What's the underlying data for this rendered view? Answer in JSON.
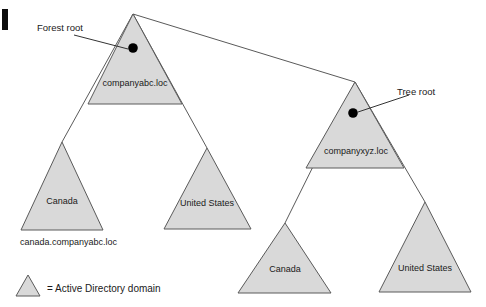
{
  "diagram": {
    "title_marker": "",
    "annotations": [
      {
        "id": "forest-root",
        "label": "Forest root"
      },
      {
        "id": "tree-root",
        "label": "Tree root"
      }
    ],
    "domains": [
      {
        "id": "companyabc",
        "label": "companyabc.loc",
        "role": "forest-root-domain"
      },
      {
        "id": "canada-abc",
        "label": "Canada",
        "role": "child-domain"
      },
      {
        "id": "us-abc",
        "label": "United States",
        "role": "child-domain"
      },
      {
        "id": "companyxyz",
        "label": "companyxyz.loc",
        "role": "tree-root-domain"
      },
      {
        "id": "canada-xyz",
        "label": "Canada",
        "role": "child-domain"
      },
      {
        "id": "us-xyz",
        "label": "United States",
        "role": "child-domain"
      }
    ],
    "captions": [
      {
        "id": "canada-fqdn",
        "label": "canada.companyabc.loc"
      }
    ],
    "legend": {
      "symbol": "triangle",
      "text": "= Active Directory domain"
    },
    "colors": {
      "domain_fill": "#d9d9d9",
      "domain_stroke": "#5a5a5a",
      "line": "#5a5a5a",
      "text": "#1a1a1a",
      "root_dot": "#000000",
      "background": "#ffffff"
    }
  }
}
